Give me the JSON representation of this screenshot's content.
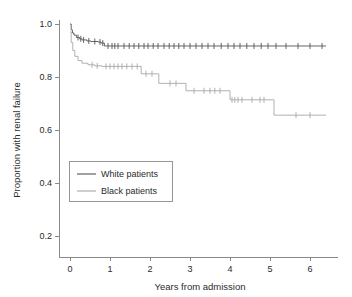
{
  "chart_data": {
    "type": "line",
    "title": "",
    "subtitle": "",
    "xlabel": "Years from admission",
    "ylabel": "Proportion with renal failure",
    "xlim": [
      -0.15,
      6.45
    ],
    "ylim": [
      0.16,
      1.02
    ],
    "xticks": [
      0,
      1,
      2,
      3,
      4,
      5,
      6
    ],
    "xticklabels": [
      "0",
      "1",
      "2",
      "3",
      "4",
      "5",
      "6"
    ],
    "yticks": [
      0.2,
      0.4,
      0.6,
      0.8,
      1.0
    ],
    "yticklabels": [
      "0.2",
      "0.4",
      "0.6",
      "0.8",
      "1.0"
    ],
    "grid": false,
    "legend_position": "center-left",
    "curve_style": "step-post (Kaplan-Meier)",
    "series": [
      {
        "name": "White patients",
        "color": "#555555",
        "legend_label": "White patients",
        "points": [
          [
            0.0,
            1.0
          ],
          [
            0.03,
            0.978
          ],
          [
            0.06,
            0.966
          ],
          [
            0.1,
            0.958
          ],
          [
            0.16,
            0.949
          ],
          [
            0.24,
            0.944
          ],
          [
            0.3,
            0.94
          ],
          [
            0.42,
            0.936
          ],
          [
            0.52,
            0.934
          ],
          [
            0.7,
            0.932
          ],
          [
            0.78,
            0.928
          ],
          [
            0.86,
            0.917
          ],
          [
            6.4,
            0.917
          ]
        ],
        "censor_times": [
          0.2,
          0.27,
          0.34,
          0.47,
          0.62,
          0.75,
          0.82,
          0.95,
          1.05,
          1.12,
          1.2,
          1.35,
          1.48,
          1.6,
          1.72,
          1.85,
          1.95,
          2.08,
          2.2,
          2.35,
          2.48,
          2.6,
          2.72,
          2.85,
          3.0,
          3.15,
          3.3,
          3.45,
          3.6,
          3.78,
          3.95,
          4.1,
          4.25,
          4.42,
          4.6,
          4.78,
          4.95,
          5.15,
          5.4,
          5.7,
          6.0,
          6.3
        ],
        "final_value": 0.917
      },
      {
        "name": "Black patients",
        "color": "#a8a8a8",
        "legend_label": "Black patients",
        "points": [
          [
            0.0,
            0.97
          ],
          [
            0.03,
            0.93
          ],
          [
            0.07,
            0.9
          ],
          [
            0.12,
            0.878
          ],
          [
            0.2,
            0.862
          ],
          [
            0.3,
            0.852
          ],
          [
            0.45,
            0.846
          ],
          [
            0.62,
            0.842
          ],
          [
            0.8,
            0.84
          ],
          [
            1.75,
            0.84
          ],
          [
            1.78,
            0.812
          ],
          [
            2.18,
            0.812
          ],
          [
            2.22,
            0.776
          ],
          [
            2.85,
            0.776
          ],
          [
            2.9,
            0.748
          ],
          [
            3.95,
            0.748
          ],
          [
            4.0,
            0.714
          ],
          [
            5.05,
            0.714
          ],
          [
            5.1,
            0.656
          ],
          [
            6.4,
            0.656
          ]
        ],
        "censor_times": [
          0.55,
          0.68,
          0.9,
          1.0,
          1.1,
          1.2,
          1.3,
          1.42,
          1.55,
          1.68,
          1.9,
          2.05,
          2.5,
          2.65,
          3.1,
          3.35,
          3.5,
          3.62,
          3.75,
          4.05,
          4.12,
          4.2,
          4.3,
          4.55,
          4.75,
          4.85,
          5.65,
          6.0
        ],
        "final_value": 0.656
      }
    ]
  },
  "axes": {
    "y_axis_title": "Proportion with renal failure",
    "x_axis_title": "Years from admission"
  },
  "legend": {
    "items": [
      {
        "label": "White patients"
      },
      {
        "label": "Black patients"
      }
    ]
  },
  "colors": {
    "white_patients": "#555555",
    "black_patients": "#a8a8a8",
    "axis": "#8a8a8a",
    "text": "#2b2b2b",
    "background": "#ffffff"
  }
}
